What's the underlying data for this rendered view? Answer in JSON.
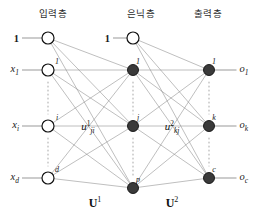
{
  "figure": {
    "colors": {
      "background": "#ffffff",
      "edge": "#8a8a8a",
      "edge_strong": "#6f6f6f",
      "node_open_stroke": "#111111",
      "node_open_fill": "#ffffff",
      "node_filled_fill": "#3a3a3a",
      "node_filled_stroke": "#111111",
      "ellipsis_dots": "#b0b0b0",
      "text": "#1a1a1a"
    }
  },
  "headers": [
    {
      "id": "input",
      "label": "입력층",
      "x": 53,
      "y": 12
    },
    {
      "id": "hidden",
      "label": "은닉층",
      "x": 141,
      "y": 12
    },
    {
      "id": "output",
      "label": "출력층",
      "x": 208,
      "y": 12
    }
  ],
  "layers": {
    "input": {
      "x": 48,
      "bias": {
        "index": "",
        "label": "1",
        "y": 38,
        "style": "open"
      },
      "nodes": [
        {
          "index": "1",
          "label": "x",
          "sub": "1",
          "y": 70,
          "style": "open"
        },
        {
          "index": "i",
          "label": "x",
          "sub": "i",
          "y": 126,
          "style": "open"
        },
        {
          "index": "d",
          "label": "x",
          "sub": "d",
          "y": 178,
          "style": "open"
        }
      ]
    },
    "hidden": {
      "x": 133,
      "bias": {
        "index": "",
        "label": "1",
        "y": 38,
        "style": "open"
      },
      "nodes": [
        {
          "index": "1",
          "y": 70,
          "style": "filled"
        },
        {
          "index": "j",
          "y": 126,
          "style": "filled"
        },
        {
          "index": "p",
          "y": 188,
          "style": "filled"
        }
      ]
    },
    "output": {
      "x": 209,
      "nodes": [
        {
          "index": "1",
          "label": "o",
          "sub": "1",
          "y": 70,
          "style": "filled"
        },
        {
          "index": "k",
          "label": "o",
          "sub": "k",
          "y": 126,
          "style": "filled"
        },
        {
          "index": "c",
          "label": "o",
          "sub": "c",
          "y": 178,
          "style": "filled"
        }
      ]
    }
  },
  "weight_labels": [
    {
      "id": "u1",
      "base": "u",
      "sup": "1",
      "sub": "ji",
      "x": 88,
      "y": 127
    },
    {
      "id": "u2",
      "base": "u",
      "sup": "2",
      "sub": "kj",
      "x": 172,
      "y": 127
    }
  ],
  "matrix_labels": [
    {
      "id": "U1",
      "base": "U",
      "sup": "1",
      "x": 95,
      "y": 203
    },
    {
      "id": "U2",
      "base": "U",
      "sup": "2",
      "x": 172,
      "y": 203
    }
  ],
  "ellipses": [
    {
      "id": "input-gap-1",
      "x": 48,
      "y1": 82,
      "y2": 114
    },
    {
      "id": "input-gap-2",
      "x": 48,
      "y1": 138,
      "y2": 166
    },
    {
      "id": "hidden-gap-1",
      "x": 133,
      "y1": 82,
      "y2": 114
    },
    {
      "id": "hidden-gap-2",
      "x": 133,
      "y1": 138,
      "y2": 176
    },
    {
      "id": "output-gap-1",
      "x": 209,
      "y1": 82,
      "y2": 114
    },
    {
      "id": "output-gap-2",
      "x": 209,
      "y1": 138,
      "y2": 166
    }
  ],
  "geometry": {
    "node_radius_open": 6,
    "node_radius_filled": 5.5,
    "stub_left_length": 20,
    "stub_right_length": 22
  }
}
